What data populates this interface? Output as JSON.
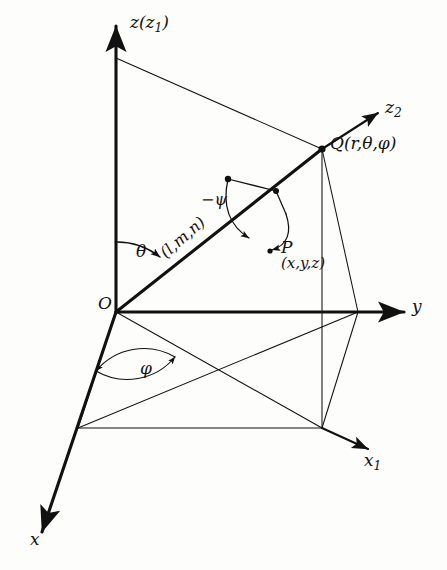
{
  "figure": {
    "background_color": "#fdfdfb",
    "line_color": "#111111"
  },
  "axes": [
    {
      "name": "z-axis",
      "label_main": "z",
      "label_paren_open": "(",
      "label_sub_base": "z",
      "label_sub": "1",
      "label_paren_close": ")",
      "full": "z(z1)"
    },
    {
      "name": "y-axis",
      "label_main": "y",
      "full": "y"
    },
    {
      "name": "x-axis",
      "label_main": "x",
      "full": "x"
    },
    {
      "name": "x1-axis",
      "label_main": "x",
      "label_sub": "1",
      "full": "x1"
    },
    {
      "name": "z2-axis",
      "label_main": "z",
      "label_sub": "2",
      "full": "z2"
    }
  ],
  "labels": {
    "origin": "O",
    "z_axis": "z",
    "z_axis_sub_open": "(z",
    "z_axis_sub_num": "1",
    "z_axis_sub_close": ")",
    "y_axis": "y",
    "x_axis": "x",
    "x1_axis": "x",
    "x1_sub": "1",
    "z2_axis": "z",
    "z2_sub": "2",
    "point_Q": "Q",
    "point_Q_coords": "(r,θ,φ)",
    "point_P": "P",
    "point_P_coords": "(x,y,z)",
    "angle_theta": "θ",
    "angle_phi": "φ",
    "angle_psi": "−ψ",
    "direction_cosines": "(l,m,n)"
  },
  "geometry": {
    "origin": {
      "x": 116,
      "y": 312
    },
    "point_Q": {
      "x": 322,
      "y": 149
    },
    "point_P_marker": {
      "x": 276,
      "y": 226
    },
    "z_axis_tip": {
      "x": 116,
      "y": 22
    },
    "y_axis_tip": {
      "x": 410,
      "y": 312
    },
    "x_axis_tip": {
      "x": 37,
      "y": 540
    },
    "x1_axis_tip": {
      "x": 372,
      "y": 452
    },
    "z2_axis_tip": {
      "x": 382,
      "y": 110
    },
    "box_front_left": {
      "x": 78,
      "y": 428
    },
    "box_front_right": {
      "x": 322,
      "y": 428
    },
    "box_back_right": {
      "x": 358,
      "y": 312
    },
    "z_top_corner": {
      "x": 116,
      "y": 58
    }
  }
}
